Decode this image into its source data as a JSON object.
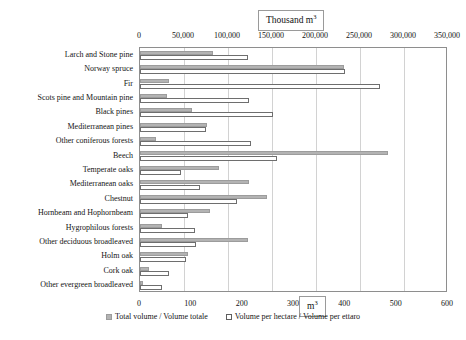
{
  "units": {
    "top_label": "Thousand m",
    "top_sup": "3",
    "bottom_label": "m",
    "bottom_sup": "3"
  },
  "legend": {
    "position": "bottom",
    "items": [
      {
        "label": "Total volume / Volume totale",
        "swatch": "total",
        "color": "#b3b3b3"
      },
      {
        "label": "Volume per hectare / Volume per ettaro",
        "swatch": "perha",
        "color": "#ffffff"
      }
    ]
  },
  "chart_data": {
    "type": "bar",
    "orientation": "horizontal",
    "title": "",
    "subtitle": "",
    "xlabel": "",
    "ylabel": "",
    "grid": true,
    "legend_position": "bottom",
    "categories": [
      "Larch and Stone pine",
      "Norway spruce",
      "Fir",
      "Scots pine and Mountain pine",
      "Black pines",
      "Mediterranean pines",
      "Other coniferous forests",
      "Beech",
      "Temperate oaks",
      "Mediterranean oaks",
      "Chestnut",
      "Hornbeam and Hophornbeam",
      "Hygrophilous forests",
      "Other deciduous broadleaved",
      "Holm oak",
      "Cork oak",
      "Other evergreen broadleaved"
    ],
    "series": [
      {
        "name": "Total volume / Volume totale",
        "axis": "top",
        "unit": "Thousand m3",
        "color": "#b3b3b3",
        "axis_range": [
          0,
          350000
        ],
        "axis_ticks": [
          0,
          50000,
          100000,
          150000,
          200000,
          250000,
          300000,
          350000
        ],
        "axis_tick_labels": [
          "0",
          "50,000",
          "100,000",
          "150,000",
          "200,000",
          "250,000",
          "300,000",
          "350,000"
        ],
        "values": [
          83000,
          232000,
          33000,
          31000,
          59000,
          76000,
          18000,
          282000,
          90000,
          124000,
          144000,
          79000,
          25000,
          123000,
          55000,
          10000,
          3000
        ]
      },
      {
        "name": "Volume per hectare / Volume per ettaro",
        "axis": "bottom",
        "unit": "m3",
        "color": "#ffffff",
        "axis_range": [
          0,
          600
        ],
        "axis_ticks": [
          0,
          100,
          200,
          300,
          400,
          500,
          600
        ],
        "axis_tick_labels": [
          "0",
          "100",
          "200",
          "300",
          "400",
          "500",
          "600"
        ],
        "values": [
          210,
          399,
          467,
          212,
          259,
          129,
          216,
          267,
          80,
          117,
          189,
          94,
          107,
          109,
          90,
          57,
          43
        ]
      }
    ]
  }
}
